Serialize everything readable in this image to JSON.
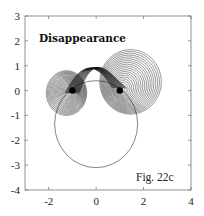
{
  "chart_data": {
    "type": "line",
    "title": "Disappearance",
    "annotation": "Fig. 22c",
    "xlabel": "",
    "ylabel": "",
    "xlim": [
      -3,
      4
    ],
    "ylim": [
      -4,
      3
    ],
    "xticks": [
      -2,
      0,
      2,
      4
    ],
    "xtick_labels": [
      "-2",
      "0",
      "2",
      "4"
    ],
    "yticks": [
      3,
      2,
      1,
      0,
      -1,
      -2,
      -3,
      -4
    ],
    "ytick_labels": [
      "3",
      "2",
      "1",
      "0",
      "-1",
      "-2",
      "-3",
      "-4"
    ],
    "grid": false,
    "legend": null,
    "elements": {
      "large_circle": {
        "center": [
          0,
          -1.35
        ],
        "radius": 1.75
      },
      "point_left": {
        "x": -1,
        "y": 0
      },
      "point_right": {
        "x": 1,
        "y": 0
      },
      "left_spiral_family": {
        "approx_center": [
          -1.25,
          0
        ],
        "outer_radius": 0.9,
        "count": 22
      },
      "right_spiral_family": {
        "approx_center": [
          1.45,
          0.35
        ],
        "outer_radius": 1.3,
        "count": 22
      },
      "connecting_band": {
        "from": [
          -0.3,
          -0.6
        ],
        "to": [
          0.6,
          1.0
        ]
      }
    }
  },
  "labels": {
    "title": "Disappearance",
    "fig": "Fig. 22c"
  }
}
